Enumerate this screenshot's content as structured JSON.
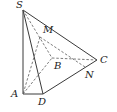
{
  "figure": {
    "type": "pyramid",
    "points": {
      "S": {
        "label": "S",
        "x": 23,
        "y": 10,
        "lx": 16,
        "ly": 8
      },
      "A": {
        "label": "A",
        "x": 23,
        "y": 94,
        "lx": 11,
        "ly": 97
      },
      "B": {
        "label": "B",
        "x": 52,
        "y": 58,
        "lx": 54,
        "ly": 69
      },
      "C": {
        "label": "C",
        "x": 97,
        "y": 60,
        "lx": 100,
        "ly": 63
      },
      "D": {
        "label": "D",
        "x": 43,
        "y": 94,
        "lx": 38,
        "ly": 105
      },
      "M": {
        "label": "M",
        "x": 40,
        "y": 37,
        "lx": 43,
        "ly": 33
      },
      "N": {
        "label": "N",
        "x": 85,
        "y": 67,
        "lx": 85,
        "ly": 78
      }
    },
    "solid_edges": [
      [
        "S",
        "A"
      ],
      [
        "S",
        "D"
      ],
      [
        "S",
        "C"
      ],
      [
        "A",
        "D"
      ],
      [
        "D",
        "C"
      ]
    ],
    "dashed_edges": [
      [
        "S",
        "B"
      ],
      [
        "A",
        "B"
      ],
      [
        "B",
        "C"
      ],
      [
        "M",
        "A"
      ],
      [
        "M",
        "N"
      ]
    ],
    "colors": {
      "line": "#3a3a3a",
      "dashed": "#5a5a5a",
      "label": "#222222",
      "background": "#ffffff"
    }
  }
}
